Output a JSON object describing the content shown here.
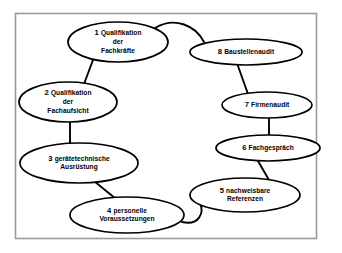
{
  "diagram": {
    "type": "cycle-diagram",
    "background_color": "#ffffff",
    "frame_color": "#9a9a9a",
    "node_stroke_color": "#000000",
    "node_fill_color": "#ffffff",
    "connector_color": "#000000",
    "nodes": [
      {
        "id": "node-1",
        "number": "1",
        "lines": [
          "Qualifikation",
          "der",
          "Fachkräfte"
        ],
        "label": "1 Qualifikation der Fachkräfte",
        "cx": 118,
        "cy": 42,
        "rx": 50,
        "ry": 20
      },
      {
        "id": "node-2",
        "number": "2",
        "lines": [
          "Qualifikation",
          "der",
          "Fachaufsicht"
        ],
        "label": "2 Qualifikation der Fachaufsicht",
        "cx": 68,
        "cy": 102,
        "rx": 49,
        "ry": 20
      },
      {
        "id": "node-3",
        "number": "3",
        "lines": [
          "gerätetechnische",
          "Ausrüstung"
        ],
        "label": "3 gerätetechnische Ausrüstung",
        "cx": 79,
        "cy": 163,
        "rx": 59,
        "ry": 20
      },
      {
        "id": "node-4",
        "number": "4",
        "lines": [
          "personelle",
          "Voraussetzungen"
        ],
        "label": "4 personelle Voraussetzungen",
        "cx": 127,
        "cy": 215,
        "rx": 57,
        "ry": 18
      },
      {
        "id": "node-5",
        "number": "5",
        "lines": [
          "nachweisbare",
          "Referenzen"
        ],
        "label": "5 nachweisbare Referenzen",
        "cx": 245,
        "cy": 195,
        "rx": 55,
        "ry": 17
      },
      {
        "id": "node-6",
        "number": "6",
        "lines": [
          "Fachgespräch"
        ],
        "label": "6 Fachgespräch",
        "cx": 268,
        "cy": 148,
        "rx": 52,
        "ry": 13
      },
      {
        "id": "node-7",
        "number": "7",
        "lines": [
          "Firmenaudit"
        ],
        "label": "7 Firmenaudit",
        "cx": 267,
        "cy": 105,
        "rx": 45,
        "ry": 13
      },
      {
        "id": "node-8",
        "number": "8",
        "lines": [
          "Baustellenaudit"
        ],
        "label": "8 Baustellenaudit",
        "cx": 246,
        "cy": 52,
        "rx": 56,
        "ry": 13
      }
    ],
    "connectors": [
      {
        "id": "connector-1-8",
        "from": "node-1",
        "to": "node-8",
        "path": "M 155 28 C 175 16 196 26 204 42"
      },
      {
        "id": "connector-1-2",
        "from": "node-1",
        "to": "node-2",
        "path": "M 93 60 L 84 84"
      },
      {
        "id": "connector-2-3",
        "from": "node-2",
        "to": "node-3",
        "path": "M 70 122 L 70 144"
      },
      {
        "id": "connector-3-4",
        "from": "node-3",
        "to": "node-4",
        "path": "M 94 181 L 116 199"
      },
      {
        "id": "connector-4-5",
        "from": "node-4",
        "to": "node-5",
        "path": "M 182 222 C 200 226 204 212 200 203"
      },
      {
        "id": "connector-5-6",
        "from": "node-5",
        "to": "node-6",
        "path": "M 269 180 L 258 161"
      },
      {
        "id": "connector-6-7",
        "from": "node-6",
        "to": "node-7",
        "path": "M 269 135 L 269 119"
      },
      {
        "id": "connector-7-8",
        "from": "node-7",
        "to": "node-8",
        "path": "M 248 94 L 238 66"
      }
    ]
  }
}
